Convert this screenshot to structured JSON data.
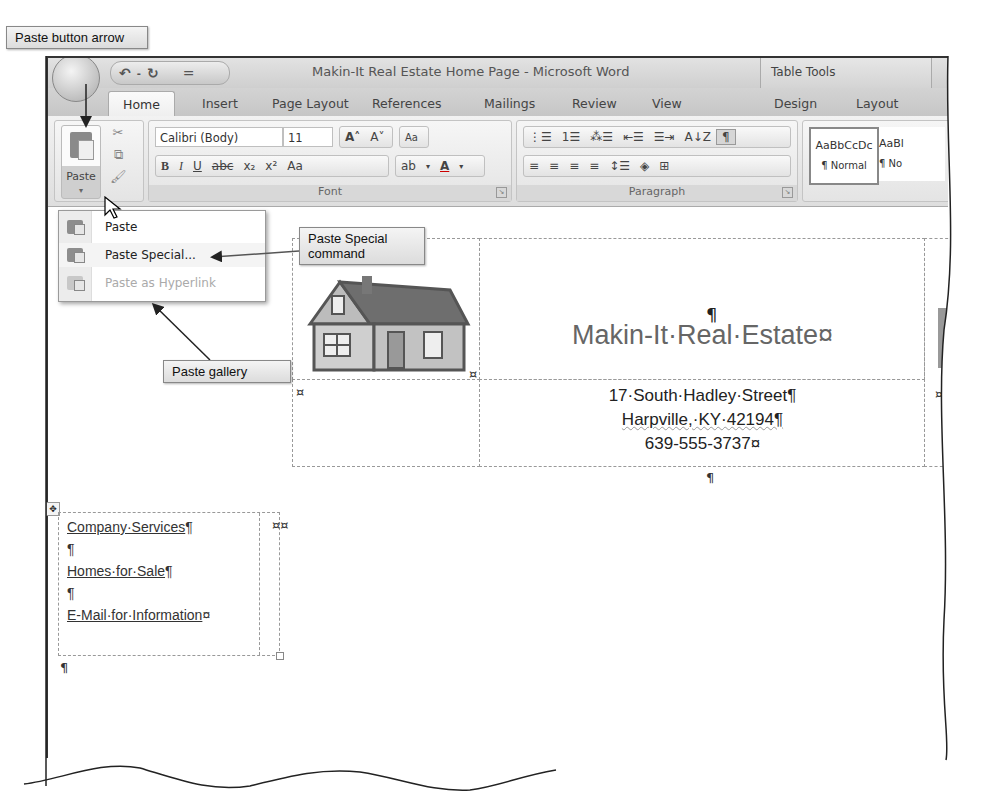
{
  "window": {
    "title": "Makin-It Real Estate Home Page - Microsoft Word",
    "contextual_tab_group": "Table Tools",
    "quick_access": {
      "undo": "↶",
      "redo": "↻",
      "customize": "="
    }
  },
  "tabs": [
    {
      "label": "Home",
      "active": true
    },
    {
      "label": "Insert"
    },
    {
      "label": "Page Layout"
    },
    {
      "label": "References"
    },
    {
      "label": "Mailings"
    },
    {
      "label": "Review"
    },
    {
      "label": "View"
    },
    {
      "label": "Design"
    },
    {
      "label": "Layout"
    }
  ],
  "ribbon": {
    "clipboard": {
      "paste_label": "Paste",
      "paste_arrow": "▾",
      "cut_icon": "✂",
      "copy_icon": "⧉",
      "format_painter_icon": "🖌"
    },
    "font": {
      "label": "Font",
      "font_name": "Calibri (Body)",
      "font_size": "11",
      "grow": "A˄",
      "shrink": "A˅",
      "clear": "Aa",
      "buttons": [
        "B",
        "I",
        "U",
        "abc",
        "x₂",
        "x²",
        "Aa"
      ],
      "highlight": "ab",
      "font_color": "A"
    },
    "paragraph": {
      "label": "Paragraph",
      "row1": [
        "⋮☰",
        "1☰",
        "⁂☰",
        "⇤☰",
        "☰⇥",
        "A↓Z",
        "¶"
      ],
      "row2": [
        "≡",
        "≡",
        "≡",
        "≡",
        "↕☰",
        "◈",
        "⊞"
      ]
    },
    "styles": {
      "items": [
        {
          "preview": "AaBbCcDc",
          "name": "¶ Normal"
        },
        {
          "preview": "AaBl",
          "name": "¶ No"
        }
      ]
    }
  },
  "paste_menu": {
    "items": [
      {
        "label": "Paste",
        "enabled": true
      },
      {
        "label": "Paste Special...",
        "enabled": true
      },
      {
        "label": "Paste as Hyperlink",
        "enabled": false
      }
    ]
  },
  "callouts": {
    "paste_button_arrow": "Paste button arrow",
    "paste_special_command": "Paste Special command",
    "paste_gallery": "Paste gallery"
  },
  "document": {
    "pilcrow": "¶",
    "heading": "Makin-It·Real·Estate¤",
    "address_lines": [
      "17·South·Hadley·Street¶",
      "Harpville,·KY·42194¶",
      "639-555-3737¤"
    ],
    "cell_marker": "¤",
    "links": [
      {
        "text": "Company·Services",
        "mark": "¶"
      },
      {
        "text": "",
        "mark": "¶"
      },
      {
        "text": "Homes·for·Sale",
        "mark": "¶"
      },
      {
        "text": "",
        "mark": "¶"
      },
      {
        "text": "E-Mail·for·Information",
        "mark": "¤"
      }
    ],
    "row_end_markers": "¤¤",
    "end_pilcrow": "¶"
  }
}
